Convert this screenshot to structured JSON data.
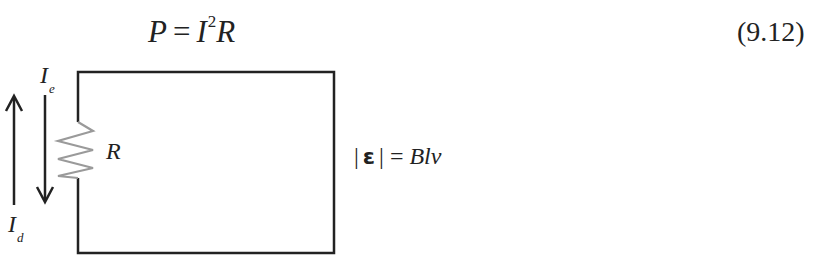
{
  "equation": {
    "lhs": "P",
    "operator": "=",
    "rhs_base": "I",
    "rhs_exponent": "2",
    "rhs_tail": "R",
    "number": "(9.12)"
  },
  "diagram": {
    "labels": {
      "induced_current": {
        "symbol": "I",
        "subscript": "e"
      },
      "drive_current": {
        "symbol": "I",
        "subscript": "d"
      },
      "resistor": "R"
    },
    "emf_equation": {
      "bar_left": "|",
      "symbol": "ε",
      "bar_right": "|",
      "operator": "=",
      "rhs": "Blv"
    },
    "colors": {
      "wire": "#222222",
      "resistor": "#9a9a9a",
      "arrow": "#222222"
    }
  }
}
